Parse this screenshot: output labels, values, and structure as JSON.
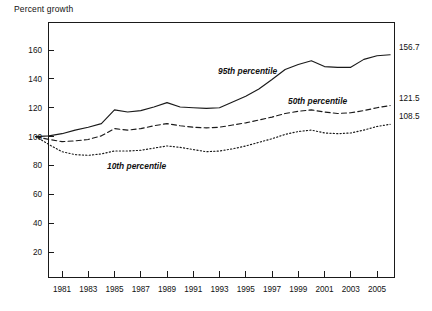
{
  "chart_data": {
    "type": "line",
    "title": "Percent growth",
    "xlabel": "",
    "ylabel": "Percent growth",
    "grid": false,
    "legend": "inline-annotations",
    "xlim": [
      1979,
      2006
    ],
    "ylim": [
      0,
      175
    ],
    "yticks": [
      20,
      40,
      60,
      80,
      100,
      120,
      140,
      160
    ],
    "ytick_labels": [
      "20",
      "40",
      "60",
      "80",
      "100",
      "120",
      "140",
      "160"
    ],
    "xticks": [
      1981,
      1983,
      1985,
      1987,
      1989,
      1991,
      1993,
      1995,
      1997,
      1999,
      2001,
      2003,
      2005
    ],
    "xtick_labels": [
      "1981",
      "1983",
      "1985",
      "1987",
      "1989",
      "1991",
      "1993",
      "1995",
      "1997",
      "1999",
      "2001",
      "2003",
      "2005"
    ],
    "x": [
      1979,
      1980,
      1981,
      1982,
      1983,
      1984,
      1985,
      1986,
      1987,
      1988,
      1989,
      1990,
      1991,
      1992,
      1993,
      1994,
      1995,
      1996,
      1997,
      1998,
      1999,
      2000,
      2001,
      2002,
      2003,
      2004,
      2005,
      2006
    ],
    "series": [
      {
        "name": "95th percentile",
        "label": "95th percentile",
        "style": "solid",
        "end_value": 156.7,
        "end_label": "156.7",
        "values": [
          100.0,
          100.5,
          102.0,
          104.5,
          106.5,
          109.0,
          118.5,
          117.0,
          118.0,
          120.5,
          123.5,
          120.5,
          120.0,
          119.5,
          120.0,
          124.0,
          128.0,
          133.0,
          139.5,
          146.5,
          150.0,
          152.5,
          148.5,
          148.0,
          148.0,
          153.5,
          156.0,
          156.7
        ]
      },
      {
        "name": "50th percentile",
        "label": "50th percentile",
        "style": "dashed",
        "end_value": 121.5,
        "end_label": "121.5",
        "values": [
          100.0,
          98.0,
          96.5,
          97.0,
          98.0,
          100.5,
          105.5,
          104.5,
          105.5,
          107.5,
          109.0,
          107.5,
          106.5,
          106.0,
          106.5,
          108.0,
          109.5,
          111.5,
          113.5,
          116.0,
          117.5,
          118.5,
          117.0,
          116.0,
          116.5,
          118.0,
          120.0,
          121.5
        ]
      },
      {
        "name": "10th percentile",
        "label": "10th percentile",
        "style": "dotted",
        "end_value": 108.5,
        "end_label": "108.5",
        "values": [
          100.0,
          94.5,
          89.5,
          87.5,
          87.0,
          88.0,
          90.0,
          90.0,
          90.5,
          92.0,
          93.5,
          92.5,
          91.0,
          89.5,
          90.0,
          91.5,
          93.5,
          96.0,
          98.5,
          101.5,
          103.5,
          104.5,
          102.5,
          102.0,
          102.5,
          104.5,
          107.0,
          108.5
        ]
      }
    ],
    "annotations": [
      {
        "text": "95th percentile",
        "x_px": 218,
        "y_px": 74
      },
      {
        "text": "50th percentile",
        "x_px": 288,
        "y_px": 104
      },
      {
        "text": "10th percentile",
        "x_px": 107,
        "y_px": 169
      }
    ]
  }
}
